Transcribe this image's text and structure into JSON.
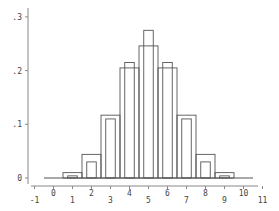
{
  "chart_data": {
    "type": "bar",
    "title": "",
    "xlabel": "",
    "ylabel": "",
    "xlim": [
      -1,
      11
    ],
    "ylim": [
      0,
      0.3
    ],
    "grid": false,
    "legend": null,
    "x_ticks": [
      "-1",
      "0",
      "1",
      "2",
      "3",
      "4",
      "5",
      "6",
      "7",
      "8",
      "9",
      "10",
      "11"
    ],
    "y_ticks": [
      "0",
      ".1",
      ".2",
      ".3"
    ],
    "categories": [
      0,
      1,
      2,
      3,
      4,
      5,
      6,
      7,
      8,
      9,
      10
    ],
    "series": [
      {
        "name": "outer (wide bars)",
        "values": [
          0.001,
          0.01,
          0.044,
          0.117,
          0.205,
          0.246,
          0.205,
          0.117,
          0.044,
          0.01,
          0.001
        ]
      },
      {
        "name": "inner (narrow bars)",
        "values": [
          0.0,
          0.004,
          0.03,
          0.11,
          0.215,
          0.275,
          0.215,
          0.11,
          0.03,
          0.004,
          0.0
        ]
      }
    ]
  },
  "colors": {
    "line": "#555555",
    "axis": "#888888",
    "background": "#ffffff"
  }
}
